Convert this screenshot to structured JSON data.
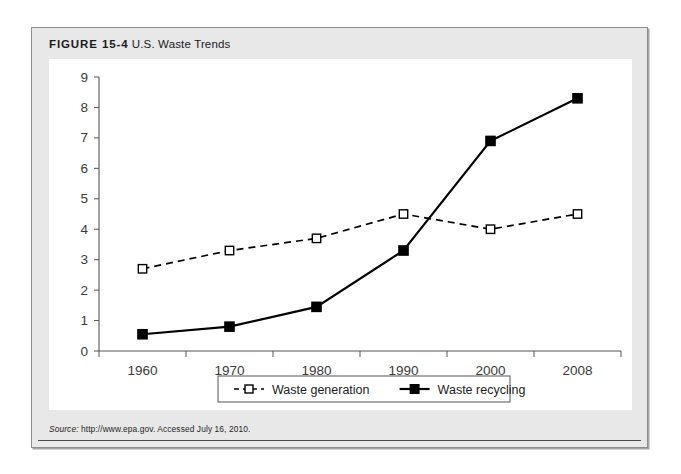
{
  "figure": {
    "number_label": "FIGURE 15-4",
    "title": "U.S. Waste Trends",
    "source_label": "Source:",
    "source_text": " http://www.epa.gov. Accessed July 16, 2010."
  },
  "chart_data": {
    "type": "line",
    "title": "U.S. Waste Trends",
    "xlabel": "",
    "ylabel": "",
    "x": [
      "1960",
      "1970",
      "1980",
      "1990",
      "2000",
      "2008"
    ],
    "categories": [
      "1960",
      "1970",
      "1980",
      "1990",
      "2000",
      "2008"
    ],
    "series": [
      {
        "name": "Waste generation",
        "values": [
          2.7,
          3.3,
          3.7,
          4.5,
          4.0,
          4.5
        ],
        "style": "dashed",
        "marker": "open-square",
        "color": "#000000"
      },
      {
        "name": "Waste recycling",
        "values": [
          0.55,
          0.8,
          1.45,
          3.3,
          6.9,
          8.3
        ],
        "style": "solid",
        "marker": "filled-square",
        "color": "#000000"
      }
    ],
    "ylim": [
      0,
      9
    ],
    "yticks": [
      "0",
      "1",
      "2",
      "3",
      "4",
      "5",
      "6",
      "7",
      "8",
      "9"
    ],
    "xticks": [
      "1960",
      "1970",
      "1980",
      "1990",
      "2000",
      "2008"
    ],
    "grid": false,
    "legend_position": "bottom-center",
    "legend": [
      "Waste generation",
      "Waste recycling"
    ]
  },
  "colors": {
    "panel_background": "#e8e8e8",
    "panel_border": "#8d8d8d",
    "plate_background": "#ffffff",
    "axis": "#555555",
    "line": "#000000",
    "text": "#1b1b1b"
  }
}
